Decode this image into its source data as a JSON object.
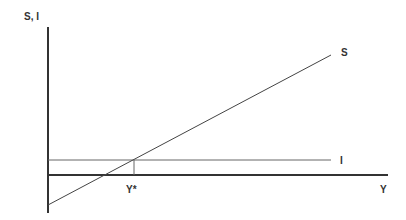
{
  "diagram": {
    "y_axis_label": "S, I",
    "x_axis_label": "Y",
    "curves": [
      {
        "name": "S",
        "label": "S",
        "type": "upward-sloping line"
      },
      {
        "name": "I",
        "label": "I",
        "type": "horizontal line"
      }
    ],
    "equilibrium_label": "Y*",
    "colors": {
      "axis": "#333333",
      "line": "#555555",
      "text": "#333333"
    }
  }
}
